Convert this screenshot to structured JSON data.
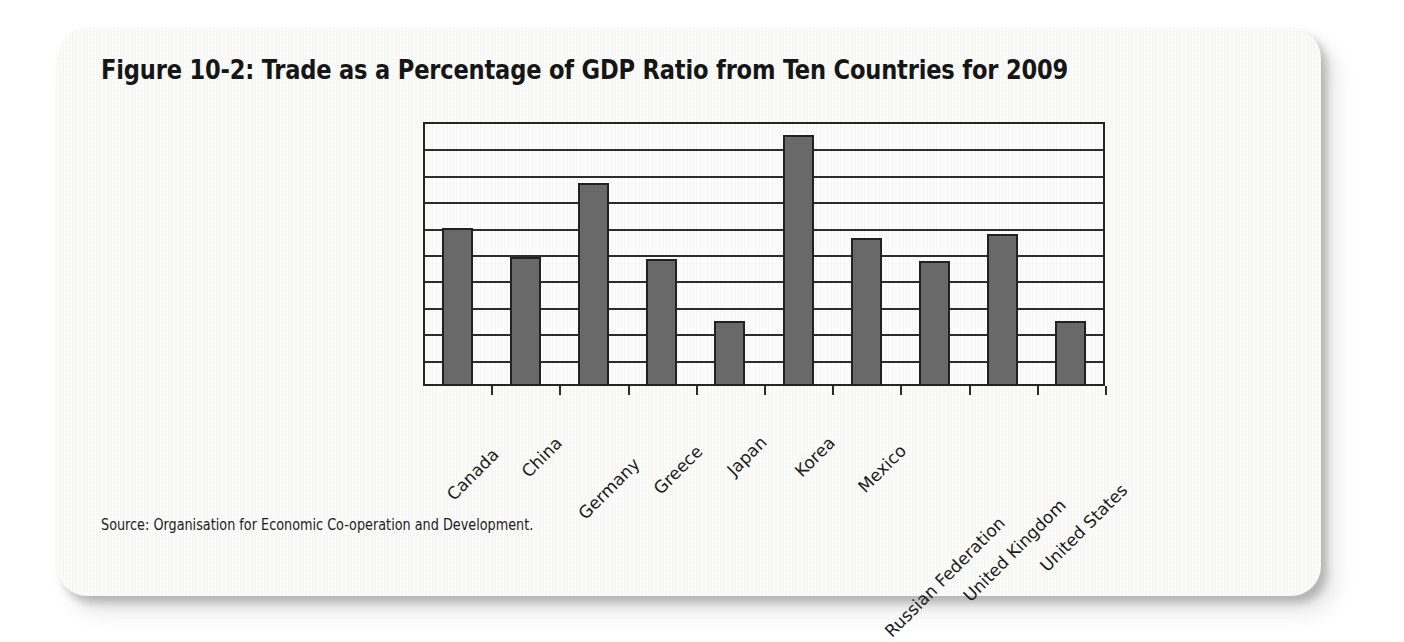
{
  "figure": {
    "title": "Figure 10-2: Trade as a Percentage of GDP Ratio from Ten Countries for 2009",
    "source": "Source: Organisation for Economic Co-operation and Development."
  },
  "colors": {
    "bar_fill": "#6a6a6a",
    "bar_stroke": "#222222",
    "axis": "#2d2d2d",
    "card_background": "#fbfbfa",
    "page_background": "#ffffff",
    "text": "#161616"
  },
  "chart_data": {
    "type": "bar",
    "title": "Figure 10-2: Trade as a Percentage of GDP Ratio from Ten Countries for 2009",
    "xlabel": "",
    "ylabel": "",
    "ylim": [
      0,
      100
    ],
    "yticks": [
      0,
      10,
      20,
      30,
      40,
      50,
      60,
      70,
      80,
      90,
      100
    ],
    "ytick_labels": [
      "0",
      "10",
      "20",
      "30",
      "40",
      "50",
      "60",
      "70",
      "80",
      "90",
      "100"
    ],
    "grid": true,
    "legend": false,
    "categories": [
      "Canada",
      "China",
      "Germany",
      "Greece",
      "Japan",
      "Korea",
      "Mexico",
      "Russian Federation",
      "United Kingdom",
      "United States"
    ],
    "values": [
      60,
      49,
      77,
      48,
      24.5,
      95,
      56,
      47.5,
      57.5,
      24.5
    ]
  }
}
